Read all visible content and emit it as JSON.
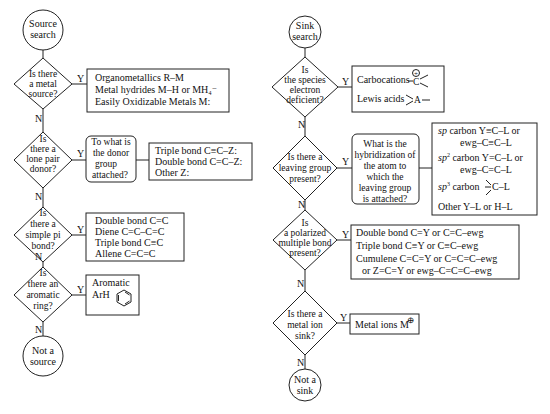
{
  "left_flowchart": {
    "start": {
      "line1": "Source",
      "line2": "search"
    },
    "end": {
      "line1": "Not a",
      "line2": "source"
    },
    "yes_label": "Y",
    "no_label": "N",
    "decisions": [
      {
        "question": [
          "Is there",
          "a metal",
          "source?"
        ],
        "result": [
          "Organometallics  R–M",
          "Metal hydrides  M–H   or MH₄⁻",
          "Easily Oxidizable Metals  M:"
        ]
      },
      {
        "question": [
          "Is",
          "there a",
          "lone pair",
          "donor?"
        ],
        "sub_question": [
          "To what is",
          "the donor",
          "group",
          "attached?"
        ],
        "result": [
          "Triple bond  C≡C–Z:",
          "Double bond  C=C–Z:",
          "Other  Z:"
        ]
      },
      {
        "question": [
          "Is",
          "there a",
          "simple pi",
          "bond?"
        ],
        "result": [
          "Double bond C=C",
          "Diene  C=C–C=C",
          "Triple bond  C≡C",
          "Allene  C=C=C"
        ]
      },
      {
        "question": [
          "Is",
          "there an",
          "aromatic",
          "ring?"
        ],
        "result": [
          "Aromatic",
          "ArH"
        ]
      }
    ]
  },
  "right_flowchart": {
    "start": {
      "line1": "Sink",
      "line2": "search"
    },
    "end": {
      "line1": "Not a",
      "line2": "sink"
    },
    "yes_label": "Y",
    "no_label": "N",
    "decisions": [
      {
        "question": [
          "Is",
          "the species",
          "electron",
          "deficient?"
        ],
        "result": [
          "Carbocations",
          "Lewis acids"
        ],
        "symbols": {
          "carbocation_charge": "+",
          "carbocation_atom": "C",
          "lewis_atom": "A"
        }
      },
      {
        "question": [
          "Is there a",
          "leaving group",
          "present?"
        ],
        "sub_question": [
          "What is the",
          "hybridization of",
          "the atom to",
          "which the",
          "leaving group",
          "is attached?"
        ],
        "result": [
          {
            "prefix": "sp",
            "sup": "",
            "text": " carbon  Y≡C–L  or"
          },
          {
            "prefix": "",
            "sup": "",
            "text": "ewg–C≡C–L"
          },
          {
            "prefix": "sp",
            "sup": "2",
            "text": " carbon  Y=C–L  or"
          },
          {
            "prefix": "",
            "sup": "",
            "text": "ewg–C=C–L"
          },
          {
            "prefix": "sp",
            "sup": "3",
            "text": " carbon"
          },
          {
            "prefix": "",
            "sup": "",
            "text": "Other   Y–L  or  H–L"
          }
        ],
        "sp3_atom": "C–L"
      },
      {
        "question": [
          "Is",
          "a polarized",
          "multiple bond",
          "present?"
        ],
        "result": [
          "Double bond  C=Y  or  C=C–ewg",
          "Triple bond  C≡Y  or  C≡C–ewg",
          "Cumulene  C=C=Y  or  C=C=C–ewg",
          "or  Z=C=Y  or  ewg–C=C=C–ewg"
        ]
      },
      {
        "question": [
          "Is there a",
          "metal ion",
          "sink?"
        ],
        "result": [
          "Metal ions  M"
        ],
        "symbols": {
          "charge": "⊕"
        }
      }
    ]
  }
}
